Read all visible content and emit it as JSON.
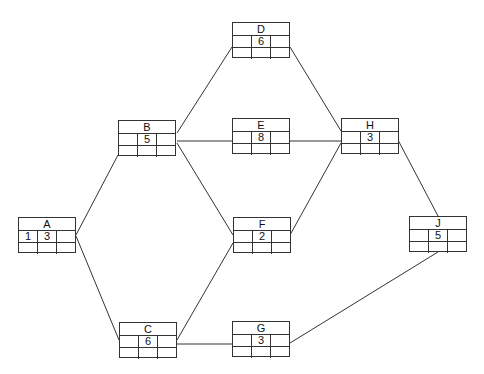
{
  "diagram": {
    "type": "activity-on-node network",
    "top_clipped_text": "",
    "nodes": [
      {
        "id": "A",
        "label": "A",
        "x": 18,
        "y": 217,
        "cells": [
          [
            "1",
            "3",
            ""
          ],
          [
            "",
            "",
            ""
          ]
        ]
      },
      {
        "id": "B",
        "label": "B",
        "x": 118,
        "y": 120,
        "cells": [
          [
            "",
            "5",
            ""
          ],
          [
            "",
            "",
            ""
          ]
        ]
      },
      {
        "id": "C",
        "label": "C",
        "x": 119,
        "y": 322,
        "cells": [
          [
            "",
            "6",
            ""
          ],
          [
            "",
            "",
            ""
          ]
        ]
      },
      {
        "id": "D",
        "label": "D",
        "x": 232,
        "y": 22,
        "cells": [
          [
            "",
            "6",
            ""
          ],
          [
            "",
            "",
            ""
          ]
        ]
      },
      {
        "id": "E",
        "label": "E",
        "x": 232,
        "y": 118,
        "cells": [
          [
            "",
            "8",
            ""
          ],
          [
            "",
            "",
            ""
          ]
        ]
      },
      {
        "id": "F",
        "label": "F",
        "x": 233,
        "y": 217,
        "cells": [
          [
            "",
            "2",
            ""
          ],
          [
            "",
            "",
            ""
          ]
        ]
      },
      {
        "id": "G",
        "label": "G",
        "x": 232,
        "y": 321,
        "cells": [
          [
            "",
            "3",
            ""
          ],
          [
            "",
            "",
            ""
          ]
        ]
      },
      {
        "id": "H",
        "label": "H",
        "x": 341,
        "y": 118,
        "cells": [
          [
            "",
            "3",
            ""
          ],
          [
            "",
            "",
            ""
          ]
        ]
      },
      {
        "id": "J",
        "label": "J",
        "x": 409,
        "y": 216,
        "cells": [
          [
            "",
            "5",
            ""
          ],
          [
            "",
            "",
            ""
          ]
        ]
      }
    ],
    "edges": [
      {
        "from": "A",
        "to": "B",
        "x1": 76,
        "y1": 235,
        "x2": 118,
        "y2": 155
      },
      {
        "from": "A",
        "to": "C",
        "x1": 76,
        "y1": 236,
        "x2": 119,
        "y2": 340
      },
      {
        "from": "B",
        "to": "D",
        "x1": 177,
        "y1": 133,
        "x2": 232,
        "y2": 47
      },
      {
        "from": "B",
        "to": "E",
        "x1": 177,
        "y1": 141,
        "x2": 232,
        "y2": 141
      },
      {
        "from": "B",
        "to": "F",
        "x1": 177,
        "y1": 143,
        "x2": 233,
        "y2": 235
      },
      {
        "from": "C",
        "to": "F",
        "x1": 177,
        "y1": 340,
        "x2": 233,
        "y2": 243
      },
      {
        "from": "C",
        "to": "G",
        "x1": 177,
        "y1": 344,
        "x2": 232,
        "y2": 344
      },
      {
        "from": "D",
        "to": "H",
        "x1": 290,
        "y1": 47,
        "x2": 341,
        "y2": 131
      },
      {
        "from": "E",
        "to": "H",
        "x1": 290,
        "y1": 141,
        "x2": 341,
        "y2": 141
      },
      {
        "from": "F",
        "to": "H",
        "x1": 290,
        "y1": 235,
        "x2": 341,
        "y2": 143
      },
      {
        "from": "H",
        "to": "J",
        "x1": 398,
        "y1": 140,
        "x2": 438,
        "y2": 216
      },
      {
        "from": "G",
        "to": "J",
        "x1": 290,
        "y1": 343,
        "x2": 438,
        "y2": 252
      }
    ],
    "colors": {
      "line": "#333333",
      "background": "#ffffff"
    }
  }
}
